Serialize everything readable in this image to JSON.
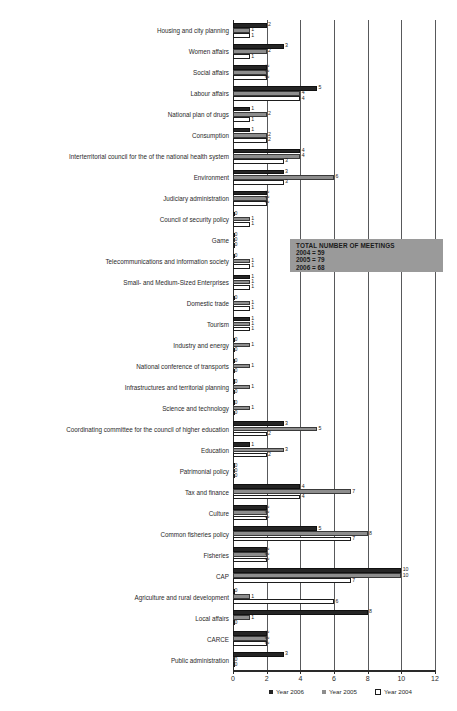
{
  "chart_data": {
    "type": "bar",
    "orientation": "horizontal",
    "title": "",
    "xlabel": "",
    "ylabel": "",
    "xlim": [
      0,
      12
    ],
    "xticks": [
      0,
      2,
      4,
      6,
      8,
      10,
      12
    ],
    "grid": true,
    "legend_position": "bottom",
    "categories": [
      "Housing and city planning",
      "Women affairs",
      "Social affairs",
      "Labour affairs",
      "National plan of drugs",
      "Consumption",
      "Interterritorial council for the of the national health system",
      "Environment",
      "Judiciary administration",
      "Council of security policy",
      "Game",
      "Telecommunications and information society",
      "Small- and Medium-Sized Enterprises",
      "Domestic trade",
      "Tourism",
      "Industry and energy",
      "National conference of transports",
      "Infrastructures and territorial planning",
      "Science and technology",
      "Coordinating committee for the council of higher education",
      "Education",
      "Patrimonial policy",
      "Tax and finance",
      "Culture",
      "Common fisheries policy",
      "Fisheries",
      "CAP",
      "Agriculture and rural development",
      "Local affairs",
      "CARCE",
      "Public administration"
    ],
    "series": [
      {
        "name": "Year 2006",
        "color": "#252525",
        "values": [
          2,
          3,
          2,
          5,
          1,
          1,
          4,
          3,
          2,
          0,
          0,
          0,
          1,
          0,
          1,
          0,
          0,
          0,
          0,
          3,
          1,
          0,
          4,
          2,
          5,
          2,
          10,
          0,
          8,
          2,
          3
        ]
      },
      {
        "name": "Year 2005",
        "color": "#8d8d8d",
        "values": [
          1,
          2,
          2,
          4,
          2,
          2,
          4,
          6,
          2,
          1,
          0,
          1,
          1,
          1,
          1,
          1,
          1,
          1,
          1,
          5,
          3,
          0,
          7,
          2,
          8,
          2,
          10,
          1,
          1,
          2,
          0
        ]
      },
      {
        "name": "Year 2004",
        "color": "#ffffff",
        "values": [
          1,
          1,
          2,
          4,
          1,
          2,
          3,
          3,
          2,
          1,
          0,
          1,
          1,
          1,
          1,
          0,
          0,
          0,
          0,
          2,
          2,
          0,
          4,
          2,
          7,
          2,
          7,
          6,
          0,
          2,
          0
        ]
      }
    ]
  },
  "annotation": {
    "title": "TOTAL NUMBER OF MEETINGS",
    "lines": [
      "2004 = 59",
      "2005 = 79",
      "2006 = 68"
    ]
  },
  "legend": {
    "items": [
      {
        "label": "Year 2006"
      },
      {
        "label": "Year 2005"
      },
      {
        "label": "Year 2004"
      }
    ]
  }
}
